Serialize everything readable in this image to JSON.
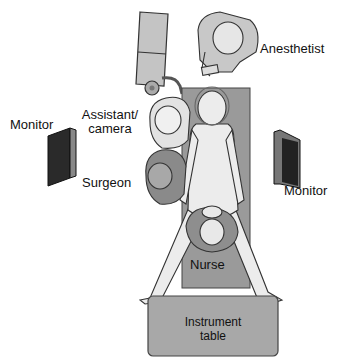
{
  "diagram": {
    "type": "operating-room-layout",
    "labels": {
      "anesthetist": "Anesthetist",
      "assistant_line1": "Assistant/",
      "assistant_line2": "camera",
      "monitor_left": "Monitor",
      "monitor_right": "Monitor",
      "surgeon": "Surgeon",
      "nurse": "Nurse",
      "instrument_table_line1": "Instrument",
      "instrument_table_line2": "table"
    },
    "colors": {
      "table_fill": "#9a9a9a",
      "person_dark": "#8a8a8a",
      "person_light": "#d8d8d8",
      "outline": "#333333",
      "monitor": "#2a2a2a",
      "instrument_table": "#a8a8a8",
      "cart": "#bdbdbd"
    }
  }
}
